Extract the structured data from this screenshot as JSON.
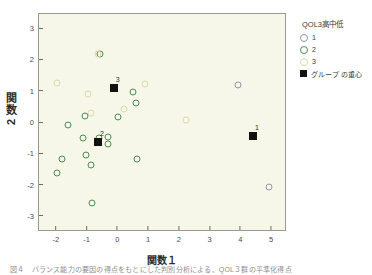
{
  "chart_data": {
    "type": "scatter",
    "title": "",
    "xlabel": "関数１",
    "ylabel": "関数２",
    "xlim": [
      -2.55,
      5.45
    ],
    "ylim": [
      -3.45,
      3.45
    ],
    "xticks": [
      "-2",
      "-1",
      "0",
      "1",
      "2",
      "3",
      "4",
      "5"
    ],
    "xtickvals": [
      -2,
      -1,
      0,
      1,
      2,
      3,
      4,
      5
    ],
    "yticks": [
      "3",
      "2",
      "1",
      "0",
      "-1",
      "-2",
      "-3"
    ],
    "ytickvals": [
      3,
      2,
      1,
      0,
      -1,
      -2,
      -3
    ],
    "grid": false,
    "legend_position": "right",
    "series": [
      {
        "name": "1",
        "color": "#8d98ad",
        "points": [
          [
            3.92,
            1.19
          ],
          [
            4.94,
            -2.07
          ]
        ]
      },
      {
        "name": "2",
        "color": "#4a8c52",
        "points": [
          [
            -1.62,
            -0.11
          ],
          [
            -1.81,
            -1.19
          ],
          [
            -1.96,
            -1.62
          ],
          [
            -1.04,
            0.2
          ],
          [
            -1.02,
            -1.06
          ],
          [
            -1.11,
            -0.51
          ],
          [
            -0.82,
            -2.59
          ],
          [
            -0.85,
            -1.36
          ],
          [
            -0.6,
            -0.5
          ],
          [
            -0.32,
            -0.49
          ],
          [
            -0.29,
            -0.7
          ],
          [
            0.02,
            0.17
          ],
          [
            0.52,
            0.96
          ],
          [
            0.6,
            0.61
          ],
          [
            0.64,
            -1.19
          ],
          [
            -0.56,
            2.18
          ]
        ]
      },
      {
        "name": "3",
        "color": "#ddd9a8",
        "points": [
          [
            -1.98,
            1.23
          ],
          [
            -0.62,
            2.18
          ],
          [
            -0.95,
            0.88
          ],
          [
            -0.85,
            0.28
          ],
          [
            0.2,
            0.41
          ],
          [
            0.91,
            1.21
          ],
          [
            2.22,
            0.05
          ]
        ]
      }
    ],
    "centroids": [
      {
        "label": "1",
        "x": 4.41,
        "y": -0.46
      },
      {
        "label": "2",
        "x": -0.63,
        "y": -0.63
      },
      {
        "label": "3",
        "x": -0.12,
        "y": 1.1
      }
    ]
  },
  "legend": {
    "title": "QOL3高中低",
    "items": [
      {
        "label": "1",
        "marker": "circle",
        "group": "g1"
      },
      {
        "label": "2",
        "marker": "circle",
        "group": "g2"
      },
      {
        "label": "3",
        "marker": "circle",
        "group": "g3"
      },
      {
        "label": "グループ の重心",
        "marker": "square",
        "group": "centroid"
      }
    ]
  },
  "axes": {
    "y_title_main": "関数",
    "y_title_num": "2",
    "x_title": "関数１"
  },
  "caption": "図４　バランス能力の要因の得点をもとにした判別分析による、QOL３群の平準化得点"
}
